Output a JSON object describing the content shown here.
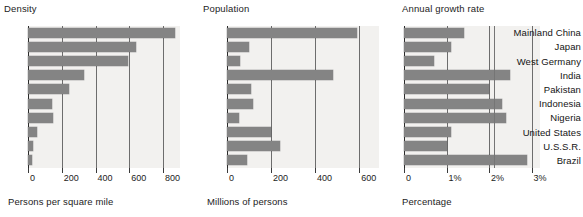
{
  "figure": {
    "categories": [
      "Mainland China",
      "Japan",
      "West Germany",
      "India",
      "Pakistan",
      "Indonesia",
      "Nigeria",
      "United States",
      "U.S.S.R.",
      "Brazil"
    ],
    "bar_color": "#848484",
    "background_color": "#f2f1ef"
  },
  "chart_data": [
    {
      "type": "bar",
      "orientation": "horizontal",
      "title": "Density",
      "xlabel": "Persons per square mile",
      "ylabel": "",
      "categories": [
        "Mainland China",
        "Japan",
        "West Germany",
        "India",
        "Pakistan",
        "Indonesia",
        "Nigeria",
        "United States",
        "U.S.S.R.",
        "Brazil"
      ],
      "values": [
        870,
        640,
        590,
        330,
        240,
        145,
        150,
        55,
        30,
        25
      ],
      "xlim": [
        0,
        900
      ],
      "ticks": [
        0,
        200,
        400,
        600,
        800
      ],
      "tick_labels": [
        "0",
        "200",
        "400",
        "600",
        "800"
      ],
      "grid": true,
      "legend": "none"
    },
    {
      "type": "bar",
      "orientation": "horizontal",
      "title": "Population",
      "xlabel": "Millions of persons",
      "ylabel": "",
      "categories": [
        "Mainland China",
        "Japan",
        "West Germany",
        "India",
        "Pakistan",
        "Indonesia",
        "Nigeria",
        "United States",
        "U.S.S.R.",
        "Brazil"
      ],
      "values": [
        590,
        100,
        60,
        480,
        110,
        120,
        55,
        200,
        240,
        90
      ],
      "xlim": [
        0,
        690
      ],
      "ticks": [
        0,
        200,
        400,
        600
      ],
      "tick_labels": [
        "0",
        "200",
        "400",
        "600"
      ],
      "grid": true,
      "legend": "none"
    },
    {
      "type": "bar",
      "orientation": "horizontal",
      "title": "Annual growth rate",
      "xlabel": "Percentage",
      "ylabel": "",
      "categories": [
        "Mainland China",
        "Japan",
        "West Germany",
        "India",
        "Pakistan",
        "Indonesia",
        "Nigeria",
        "United States",
        "U.S.S.R.",
        "Brazil"
      ],
      "values": [
        1.4,
        1.1,
        0.7,
        2.5,
        2.0,
        2.3,
        2.4,
        1.1,
        1.0,
        2.9
      ],
      "xlim": [
        0,
        3.2
      ],
      "ticks": [
        0,
        1,
        2,
        3
      ],
      "tick_labels": [
        "0",
        "1%",
        "2%",
        "3%"
      ],
      "grid": true,
      "legend": "none"
    }
  ]
}
